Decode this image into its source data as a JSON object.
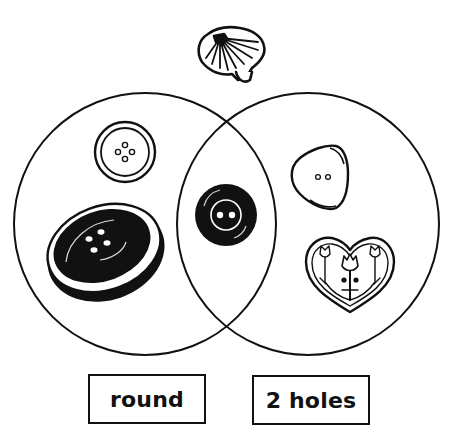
{
  "diagram": {
    "type": "venn",
    "sets": [
      {
        "label": "round",
        "items": [
          "white round button with 4 holes",
          "large black oval button with 4 holes"
        ]
      },
      {
        "label": "2 holes",
        "items": [
          "triangular button with 2 holes",
          "heart-shaped button with flower design"
        ]
      }
    ],
    "intersection": [
      "black round button with 2 holes"
    ],
    "outside": [
      "scallop shell button"
    ]
  },
  "labels": {
    "left": "round",
    "right": "2 holes"
  },
  "colors": {
    "stroke": "#111111",
    "background": "#ffffff"
  }
}
